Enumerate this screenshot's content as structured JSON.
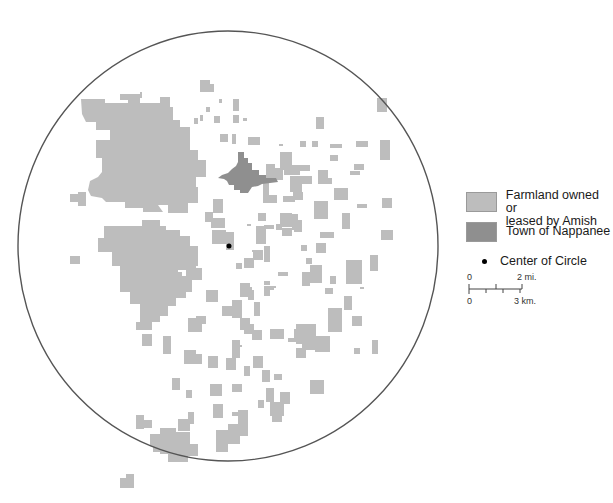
{
  "map": {
    "circle": {
      "cx": 228,
      "cy": 246,
      "rx": 210,
      "ry": 215,
      "stroke": "#555555"
    },
    "center_point": {
      "cx": 229,
      "cy": 246,
      "r": 2.5,
      "color": "#000000"
    },
    "colors": {
      "farmland": "#bdbdbd",
      "town": "#8f8f8f"
    },
    "town_polygon": "238,152 244,152 244,158 248,158 248,163 252,163 252,170 259,170 259,175 266,175 266,178 276,178 278,182 270,183 262,184 258,186 252,187 248,193 240,193 240,190 234,190 234,185 229,185 227,181 224,179 218,178 222,175 228,173 232,169 236,166 238,162",
    "farmland_polygons": [
      "81,99 105,99 105,103 128,103 128,94 140,94 140,103 160,103 160,97 170,97 170,107 173,107 173,120 180,120 180,127 190,127 190,150 198,150 198,160 206,160 206,177 196,177 196,187 198,187 198,203 188,203 188,213 168,213 168,205 158,205 163,212 143,212 143,208 125,208 125,202 106,202 102,198 91,196 88,190 90,181 98,177 102,172 102,158 96,158 96,140 110,140 110,130 96,130 96,122 86,122 82,114",
      "104,226 142,226 142,220 160,220 160,226 166,226 166,230 180,230 180,236 190,236 190,246 198,246 198,266 178,266 178,292 176,292 176,306 168,306 168,316 160,316 160,322 152,322 152,330 136,330 136,322 140,322 140,304 130,304 130,292 120,292 120,266 112,266 112,252 98,252 98,238 104,238",
      "170,272 182,272 182,276 192,276 192,292 186,292 186,298 176,298 176,292 170,292",
      "216,430 228,430 228,424 238,424 238,410 248,410 248,436 240,436 240,444 228,444 228,452 216,452",
      "160,428 176,428 176,432 190,432 190,444 198,444 198,456 188,456 188,462 168,462 168,454 160,454 160,446 150,446 150,434 160,434",
      "176,258 196,258 196,268 202,268 202,280 186,280 186,270 176,270",
      "280,152 292,152 292,165 300,165 300,175 284,175 284,170 280,170",
      "296,324 316,324 316,336 322,336 322,350 302,350 302,344 296,344",
      "200,80 210,80 210,84 214,84 214,92 200,92",
      "315,336 330,336 330,352 315,352",
      "266,164 275,164 275,168 283,168 283,180 266,180",
      "290,176 312,176 312,184 290,184"
    ],
    "farmland_rects": [
      [
        78,
        192,
        8,
        14
      ],
      [
        70,
        194,
        10,
        8
      ],
      [
        120,
        94,
        12,
        6
      ],
      [
        140,
        92,
        2,
        6
      ],
      [
        200,
        115,
        3,
        6
      ],
      [
        206,
        107,
        4,
        5
      ],
      [
        214,
        116,
        6,
        7
      ],
      [
        233,
        115,
        6,
        8
      ],
      [
        233,
        99,
        6,
        12
      ],
      [
        243,
        118,
        4,
        3
      ],
      [
        220,
        134,
        8,
        8
      ],
      [
        232,
        134,
        4,
        10
      ],
      [
        194,
        118,
        4,
        6
      ],
      [
        219,
        99,
        3,
        4
      ],
      [
        150,
        270,
        12,
        12
      ],
      [
        70,
        256,
        10,
        8
      ],
      [
        142,
        334,
        10,
        12
      ],
      [
        144,
        308,
        10,
        12
      ],
      [
        163,
        336,
        8,
        18
      ],
      [
        188,
        318,
        14,
        14
      ],
      [
        206,
        290,
        12,
        12
      ],
      [
        222,
        306,
        12,
        10
      ],
      [
        196,
        316,
        10,
        8
      ],
      [
        232,
        300,
        10,
        18
      ],
      [
        232,
        340,
        8,
        18
      ],
      [
        244,
        324,
        10,
        10
      ],
      [
        184,
        350,
        12,
        14
      ],
      [
        196,
        354,
        6,
        10
      ],
      [
        208,
        356,
        10,
        12
      ],
      [
        226,
        358,
        10,
        12
      ],
      [
        172,
        378,
        8,
        12
      ],
      [
        186,
        390,
        6,
        8
      ],
      [
        210,
        384,
        12,
        12
      ],
      [
        232,
        384,
        10,
        8
      ],
      [
        240,
        318,
        10,
        12
      ],
      [
        252,
        330,
        10,
        10
      ],
      [
        254,
        302,
        6,
        14
      ],
      [
        264,
        286,
        6,
        10
      ],
      [
        213,
        199,
        10,
        14
      ],
      [
        211,
        218,
        14,
        10
      ],
      [
        212,
        230,
        14,
        14
      ],
      [
        205,
        212,
        8,
        10
      ],
      [
        226,
        232,
        8,
        18
      ],
      [
        258,
        213,
        8,
        8
      ],
      [
        256,
        226,
        10,
        18
      ],
      [
        282,
        228,
        10,
        8
      ],
      [
        300,
        141,
        6,
        6
      ],
      [
        312,
        141,
        6,
        6
      ],
      [
        279,
        144,
        4,
        2
      ],
      [
        264,
        246,
        6,
        16
      ],
      [
        276,
        224,
        6,
        6
      ],
      [
        247,
        224,
        4,
        2
      ],
      [
        248,
        137,
        12,
        8
      ],
      [
        264,
        225,
        10,
        4
      ],
      [
        290,
        184,
        12,
        8
      ],
      [
        263,
        181,
        6,
        14
      ],
      [
        263,
        195,
        14,
        8
      ],
      [
        314,
        201,
        14,
        18
      ],
      [
        334,
        188,
        14,
        12
      ],
      [
        300,
        165,
        10,
        6
      ],
      [
        330,
        155,
        8,
        6
      ],
      [
        318,
        170,
        10,
        14
      ],
      [
        326,
        178,
        6,
        6
      ],
      [
        330,
        144,
        12,
        4
      ],
      [
        350,
        171,
        10,
        4
      ],
      [
        356,
        141,
        12,
        6
      ],
      [
        354,
        164,
        10,
        6
      ],
      [
        361,
        141,
        2,
        2
      ],
      [
        280,
        213,
        12,
        14
      ],
      [
        292,
        220,
        10,
        10
      ],
      [
        283,
        196,
        12,
        6
      ],
      [
        293,
        192,
        10,
        8
      ],
      [
        316,
        243,
        10,
        10
      ],
      [
        320,
        232,
        14,
        6
      ],
      [
        306,
        258,
        6,
        6
      ],
      [
        292,
        214,
        6,
        6
      ],
      [
        342,
        213,
        8,
        16
      ],
      [
        357,
        204,
        10,
        4
      ],
      [
        294,
        228,
        8,
        4
      ],
      [
        301,
        245,
        6,
        6
      ],
      [
        380,
        140,
        10,
        20
      ],
      [
        382,
        198,
        10,
        10
      ],
      [
        381,
        230,
        12,
        10
      ],
      [
        377,
        98,
        10,
        14
      ],
      [
        316,
        117,
        8,
        12
      ],
      [
        346,
        260,
        16,
        24
      ],
      [
        310,
        265,
        12,
        18
      ],
      [
        302,
        272,
        8,
        14
      ],
      [
        240,
        283,
        10,
        14
      ],
      [
        246,
        287,
        6,
        6
      ],
      [
        236,
        263,
        6,
        6
      ],
      [
        244,
        258,
        10,
        10
      ],
      [
        253,
        250,
        10,
        10
      ],
      [
        264,
        281,
        6,
        4
      ],
      [
        272,
        286,
        4,
        2
      ],
      [
        270,
        329,
        14,
        10
      ],
      [
        288,
        338,
        8,
        4
      ],
      [
        294,
        329,
        6,
        12
      ],
      [
        310,
        380,
        14,
        14
      ],
      [
        296,
        348,
        10,
        10
      ],
      [
        262,
        370,
        8,
        12
      ],
      [
        274,
        374,
        8,
        6
      ],
      [
        252,
        250,
        4,
        2
      ],
      [
        328,
        308,
        14,
        24
      ],
      [
        352,
        316,
        10,
        10
      ],
      [
        372,
        340,
        6,
        14
      ],
      [
        354,
        348,
        6,
        6
      ],
      [
        370,
        255,
        8,
        16
      ],
      [
        330,
        276,
        6,
        8
      ],
      [
        344,
        296,
        8,
        14
      ],
      [
        325,
        288,
        8,
        6
      ],
      [
        253,
        356,
        10,
        12
      ],
      [
        266,
        388,
        8,
        14
      ],
      [
        280,
        392,
        10,
        12
      ],
      [
        244,
        366,
        6,
        10
      ],
      [
        232,
        412,
        8,
        4
      ],
      [
        258,
        400,
        6,
        8
      ],
      [
        270,
        402,
        14,
        14
      ],
      [
        272,
        412,
        10,
        10
      ],
      [
        248,
        290,
        6,
        10
      ],
      [
        268,
        286,
        6,
        4
      ],
      [
        278,
        272,
        10,
        4
      ],
      [
        136,
        415,
        8,
        14
      ],
      [
        144,
        420,
        8,
        8
      ],
      [
        153,
        440,
        10,
        12
      ],
      [
        178,
        419,
        12,
        12
      ],
      [
        188,
        412,
        6,
        12
      ],
      [
        213,
        404,
        10,
        14
      ],
      [
        120,
        478,
        14,
        10
      ],
      [
        126,
        474,
        8,
        8
      ],
      [
        238,
        345,
        4,
        2
      ],
      [
        312,
        343,
        4,
        2
      ],
      [
        360,
        287,
        4,
        2
      ]
    ]
  },
  "legend": {
    "items": [
      {
        "label_line1": "Farmland owned or",
        "label_line2": "leased by Amish"
      },
      {
        "label": "Town of Nappanee"
      },
      {
        "label": "Center of Circle"
      }
    ]
  },
  "scale": {
    "top_zero": "0",
    "top_max": "2 mi.",
    "bottom_zero": "0",
    "bottom_max": "3 km."
  }
}
